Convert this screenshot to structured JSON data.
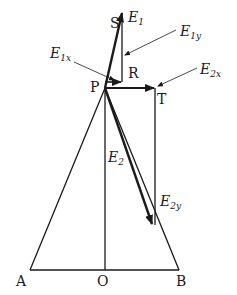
{
  "diagram": {
    "points": {
      "A": {
        "label": "A",
        "x": 30,
        "y": 270
      },
      "O": {
        "label": "O",
        "x": 105,
        "y": 270
      },
      "B": {
        "label": "B",
        "x": 179,
        "y": 270
      },
      "P": {
        "label": "P",
        "x": 105,
        "y": 88
      },
      "S": {
        "label": "S",
        "x": 122,
        "y": 12
      },
      "R": {
        "label": "R",
        "x": 122,
        "y": 80
      },
      "T": {
        "label": "T",
        "x": 155,
        "y": 88
      }
    },
    "vectors": {
      "E1": {
        "base": "E",
        "sub": "1"
      },
      "E1x": {
        "base": "E",
        "sub": "1x"
      },
      "E1y": {
        "base": "E",
        "sub": "1y"
      },
      "E2": {
        "base": "E",
        "sub": "2"
      },
      "E2x": {
        "base": "E",
        "sub": "2x"
      },
      "E2y": {
        "base": "E",
        "sub": "2y"
      }
    },
    "colors": {
      "stroke": "#1a1a1a",
      "background": "#ffffff"
    }
  }
}
